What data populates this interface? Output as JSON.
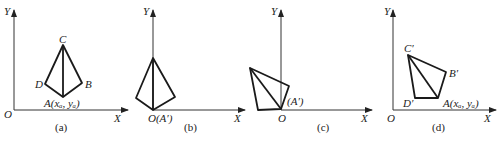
{
  "figure": {
    "panels": [
      {
        "id": "a",
        "caption": "(a)",
        "axis_labels": {
          "x": "X",
          "y": "Y",
          "origin": "O"
        },
        "vertex_labels": {
          "C": "C",
          "D": "D",
          "B": "B",
          "A": "A(xₐ, yₐ)"
        }
      },
      {
        "id": "b",
        "caption": "(b)",
        "axis_labels": {
          "x": "X",
          "y": "Y",
          "origin": "O(A′)"
        }
      },
      {
        "id": "c",
        "caption": "(c)",
        "axis_labels": {
          "x": "X",
          "y": "Y",
          "origin": "O"
        },
        "vertex_labels": {
          "A": "(A′)"
        }
      },
      {
        "id": "d",
        "caption": "(d)",
        "axis_labels": {
          "x": "X",
          "y": "Y",
          "origin": "O"
        },
        "vertex_labels": {
          "C": "C′",
          "B": "B′",
          "D": "D′",
          "A": "A(xₐ, yₐ)"
        }
      }
    ]
  }
}
